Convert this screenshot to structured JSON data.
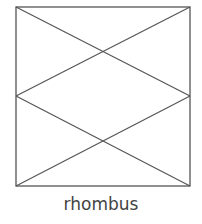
{
  "figure": {
    "caption": "rhombus",
    "stroke_color": "#555555",
    "square": {
      "x": 16,
      "y": 7,
      "width": 174,
      "height": 179
    },
    "lines": [
      {
        "x1": 16,
        "y1": 7,
        "x2": 190,
        "y2": 96
      },
      {
        "x1": 190,
        "y1": 7,
        "x2": 16,
        "y2": 96
      },
      {
        "x1": 16,
        "y1": 96,
        "x2": 190,
        "y2": 186
      },
      {
        "x1": 190,
        "y1": 96,
        "x2": 16,
        "y2": 186
      }
    ]
  }
}
